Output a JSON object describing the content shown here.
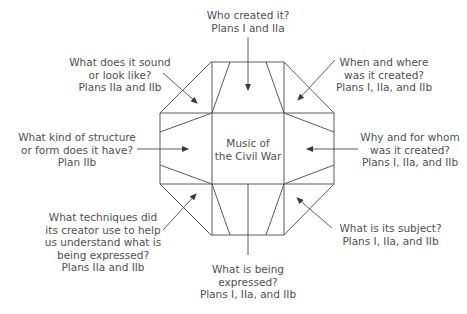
{
  "center": {
    "line1": "Music of",
    "line2": "the Civil War"
  },
  "labels": {
    "top": {
      "lines": [
        "Who created it?",
        "Plans I and IIa"
      ]
    },
    "top_left": {
      "lines": [
        "What does it sound",
        "or look like?",
        "Plans IIa and IIb"
      ]
    },
    "top_right": {
      "lines": [
        "When and where",
        "was it created?",
        "Plans I, IIa, and IIb"
      ]
    },
    "left": {
      "lines": [
        "What kind of structure",
        "or form does it have?",
        "Plan IIb"
      ]
    },
    "right": {
      "lines": [
        "Why and for whom",
        "was it created?",
        "Plans I, IIa, and IIb"
      ]
    },
    "bottom_left": {
      "lines": [
        "What techniques did",
        "its creator use to help",
        "us understand what is",
        "being expressed?",
        "Plans IIa and IIb"
      ]
    },
    "bottom_right": {
      "lines": [
        "What is its subject?",
        "Plans I, IIa, and IIb"
      ]
    },
    "bottom": {
      "lines": [
        "What is being",
        "expressed?",
        "Plans I, IIa, and IIb"
      ]
    }
  },
  "colors": {
    "stroke": "#5a5a5a",
    "text": "#4f4f4f",
    "background": "#ffffff"
  }
}
